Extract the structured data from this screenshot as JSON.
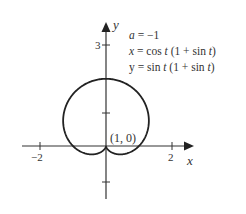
{
  "chart_data": {
    "type": "line",
    "title": "",
    "curve": "parametric",
    "parameter": "t",
    "t_range": [
      0,
      6.283
    ],
    "equations": {
      "a": "a = −1",
      "x": "x = cos t (1 + sin t)",
      "y": "y = sin t (1 + sin t)"
    },
    "xlabel": "x",
    "ylabel": "y",
    "x_ticks": [
      -2,
      -1,
      1,
      2
    ],
    "x_tick_labels": [
      "−2",
      "2"
    ],
    "y_ticks": [
      -1,
      1,
      2,
      3
    ],
    "y_tick_labels": [
      "3"
    ],
    "xlim": [
      -2.6,
      2.6
    ],
    "ylim": [
      -1.6,
      3.5
    ],
    "grid": false,
    "annotations": [
      {
        "text": "(1, 0)",
        "x": 1,
        "y": 0
      }
    ],
    "series": [
      {
        "name": "a = −1",
        "color": "#222222"
      }
    ]
  },
  "labels": {
    "y_axis": "y",
    "x_axis": "x",
    "tick_3": "3",
    "tick_neg2": "−2",
    "tick_2": "2",
    "point": "(1, 0)",
    "eq_a": "a = −1",
    "eq_x": "x = cos t (1 + sin t)",
    "eq_y": "y = sin t (1 + sin t)"
  }
}
